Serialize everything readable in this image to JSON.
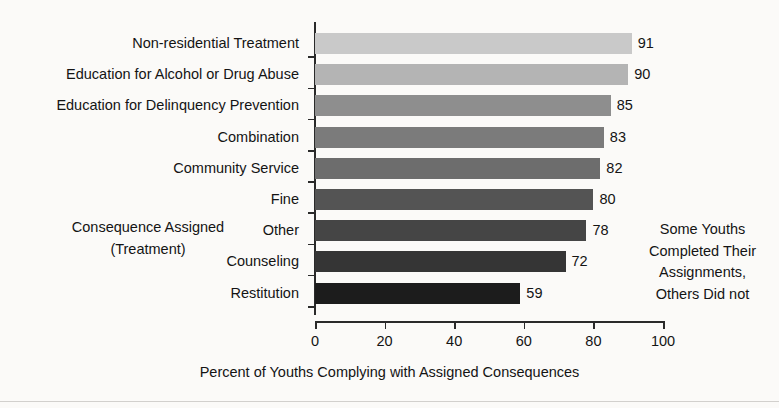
{
  "chart_data": {
    "type": "bar",
    "orientation": "horizontal",
    "title": "",
    "xlabel": "Percent of Youths Complying with Assigned Consequences",
    "ylabel": "Consequence Assigned\n(Treatment)",
    "ylabel_line1": "Consequence Assigned",
    "ylabel_line2": "(Treatment)",
    "categories": [
      "Non-residential Treatment",
      "Education for Alcohol or Drug Abuse",
      "Education for Delinquency Prevention",
      "Combination",
      "Community Service",
      "Fine",
      "Other",
      "Counseling",
      "Restitution"
    ],
    "values": [
      91,
      90,
      85,
      83,
      82,
      80,
      78,
      72,
      59
    ],
    "bar_colors": [
      "#c9c9c9",
      "#b4b4b4",
      "#8e8e8e",
      "#7b7b7b",
      "#6d6d6d",
      "#545454",
      "#454545",
      "#353535",
      "#1c1c1c"
    ],
    "xlim": [
      0,
      100
    ],
    "xticks": [
      0,
      20,
      40,
      60,
      80,
      100
    ],
    "xtick_labels": [
      "0",
      "20",
      "40",
      "60",
      "80",
      "100"
    ],
    "grid": false,
    "legend": false,
    "annotations": [
      {
        "lines": [
          "Some Youths",
          "Completed Their",
          "Assignments,",
          "Others Did not"
        ]
      }
    ]
  }
}
